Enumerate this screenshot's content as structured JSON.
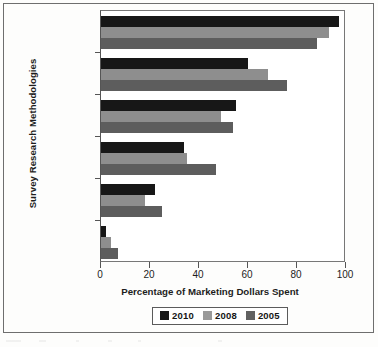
{
  "chart_data": {
    "type": "bar",
    "orientation": "horizontal",
    "title": "",
    "xlabel": "Percentage of Marketing Dollars Spent",
    "ylabel": "Survey Research Methodologies",
    "categories": [
      "Online",
      "Telephone",
      "In-Person",
      "Mail",
      "Mail Intercept",
      "Other"
    ],
    "series": [
      {
        "name": "2010",
        "color": "#171717",
        "values": [
          97,
          60,
          55,
          34,
          22,
          2
        ]
      },
      {
        "name": "2008",
        "color": "#8e8e8e",
        "values": [
          93,
          68,
          49,
          35,
          18,
          4
        ]
      },
      {
        "name": "2005",
        "color": "#5d5d5d",
        "values": [
          88,
          76,
          54,
          47,
          25,
          7
        ]
      }
    ],
    "xlim": [
      0,
      100
    ],
    "xticks": [
      0,
      20,
      40,
      60,
      80,
      100
    ],
    "xtick_labels": [
      "0",
      "20",
      "40",
      "60",
      "80",
      "100"
    ],
    "grid": false,
    "legend_position": "bottom"
  },
  "legend": {
    "entries": [
      {
        "label": "2010"
      },
      {
        "label": "2008"
      },
      {
        "label": "2005"
      }
    ]
  }
}
